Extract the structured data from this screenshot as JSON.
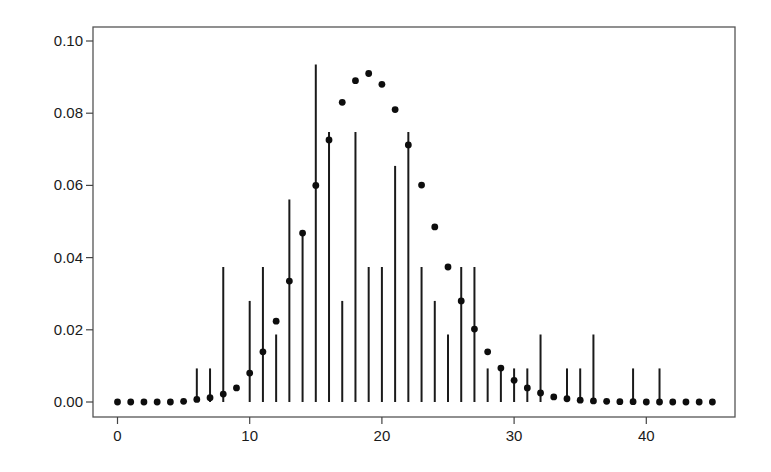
{
  "chart_data": {
    "type": "scatter",
    "title": "",
    "xlabel": "",
    "ylabel": "",
    "xlim": [
      -2,
      46.5
    ],
    "ylim": [
      -0.004,
      0.104
    ],
    "grid": false,
    "legend": null,
    "x_ticks": [
      0,
      10,
      20,
      30,
      40
    ],
    "x_tick_labels": [
      "0",
      "10",
      "20",
      "30",
      "40"
    ],
    "y_ticks": [
      0.0,
      0.02,
      0.04,
      0.06,
      0.08,
      0.1
    ],
    "y_tick_labels": [
      "0.00",
      "0.02",
      "0.04",
      "0.06",
      "0.08",
      "0.10"
    ],
    "series": [
      {
        "name": "observed relative frequency",
        "style": "vertical-lines",
        "x": [
          6,
          7,
          8,
          10,
          11,
          12,
          13,
          14,
          15,
          16,
          17,
          18,
          19,
          20,
          21,
          22,
          23,
          24,
          25,
          26,
          27,
          28,
          29,
          30,
          31,
          32,
          34,
          35,
          36,
          39,
          41
        ],
        "values": [
          0.0093,
          0.0093,
          0.0374,
          0.028,
          0.0374,
          0.0187,
          0.0561,
          0.0467,
          0.0935,
          0.0748,
          0.028,
          0.0748,
          0.0374,
          0.0374,
          0.0654,
          0.0748,
          0.0374,
          0.028,
          0.0187,
          0.0374,
          0.0374,
          0.0093,
          0.0093,
          0.0093,
          0.0093,
          0.0187,
          0.0093,
          0.0093,
          0.0187,
          0.0093,
          0.0093
        ]
      },
      {
        "name": "fitted probability",
        "style": "points",
        "x": [
          0,
          1,
          2,
          3,
          4,
          5,
          6,
          7,
          8,
          9,
          10,
          11,
          12,
          13,
          14,
          15,
          16,
          17,
          18,
          19,
          20,
          21,
          22,
          23,
          24,
          25,
          26,
          27,
          28,
          29,
          30,
          31,
          32,
          33,
          34,
          35,
          36,
          37,
          38,
          39,
          40,
          41,
          42,
          43,
          44,
          45
        ],
        "values": [
          0.0,
          0.0,
          0.0,
          0.0,
          0.0,
          0.0002,
          0.0007,
          0.0012,
          0.0022,
          0.0039,
          0.008,
          0.0139,
          0.0224,
          0.0335,
          0.0468,
          0.06,
          0.0726,
          0.083,
          0.089,
          0.091,
          0.088,
          0.081,
          0.0712,
          0.0601,
          0.0485,
          0.0374,
          0.028,
          0.0202,
          0.0139,
          0.0094,
          0.006,
          0.0039,
          0.0025,
          0.0014,
          0.0009,
          0.0005,
          0.0003,
          0.0002,
          0.0001,
          0.0001,
          0.0,
          0.0,
          0.0,
          0.0,
          0.0,
          0.0
        ]
      }
    ]
  },
  "colors": {
    "background": "#ffffff",
    "ink": "#111111",
    "frame": "#555555"
  }
}
